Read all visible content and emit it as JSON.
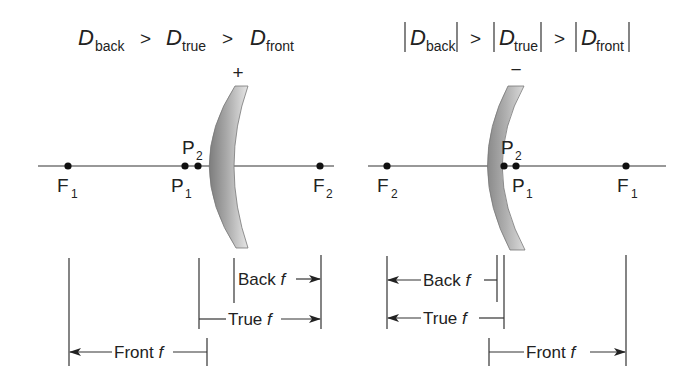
{
  "left_panel": {
    "relation": {
      "d1": "D",
      "d1_sub": "back",
      "op1": ">",
      "d2": "D",
      "d2_sub": "true",
      "op2": ">",
      "d3": "D",
      "d3_sub": "front"
    },
    "lens_sign": "+",
    "points": {
      "f1": {
        "main": "F",
        "sub": "1"
      },
      "p1": {
        "main": "P",
        "sub": "1"
      },
      "p2": {
        "main": "P",
        "sub": "2"
      },
      "f2": {
        "main": "F",
        "sub": "2"
      }
    },
    "dimensions": {
      "back": {
        "label": "Back ",
        "f": "f"
      },
      "true": {
        "label": "True ",
        "f": "f"
      },
      "front": {
        "label": "Front ",
        "f": "f"
      }
    }
  },
  "right_panel": {
    "relation": {
      "bar": "|",
      "d1": "D",
      "d1_sub": "back",
      "op1": ">",
      "d2": "D",
      "d2_sub": "true",
      "op2": ">",
      "d3": "D",
      "d3_sub": "front"
    },
    "lens_sign": "−",
    "points": {
      "f2": {
        "main": "F",
        "sub": "2"
      },
      "p2": {
        "main": "P",
        "sub": "2"
      },
      "p1": {
        "main": "P",
        "sub": "1"
      },
      "f1": {
        "main": "F",
        "sub": "1"
      }
    },
    "dimensions": {
      "back": {
        "label": "Back ",
        "f": "f"
      },
      "true": {
        "label": "True ",
        "f": "f"
      },
      "front": {
        "label": "Front ",
        "f": "f"
      }
    }
  },
  "colors": {
    "line": "#333333",
    "lens_light": "#eeeeee",
    "lens_dark": "#8a8a8a"
  }
}
